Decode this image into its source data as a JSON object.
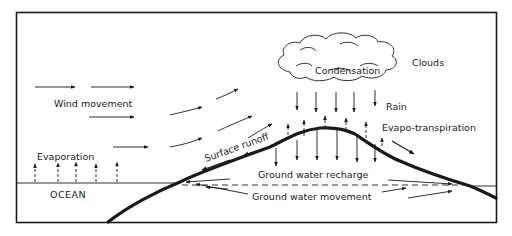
{
  "diagram": {
    "type": "hydrologic-cycle",
    "labels": {
      "clouds": "Clouds",
      "condensation": "Condensation",
      "rain": "Rain",
      "wind_movement": "Wind movement",
      "evaporation": "Evaporation",
      "evapo_transpiration": "Evapo-transpiration",
      "surface_runoff": "Surface runoff",
      "ground_water_recharge": "Ground water recharge",
      "ground_water_movement": "Ground water movement",
      "ocean": "OCEAN"
    },
    "colors": {
      "ink": "#1a1a1a",
      "background": "#ffffff"
    }
  }
}
